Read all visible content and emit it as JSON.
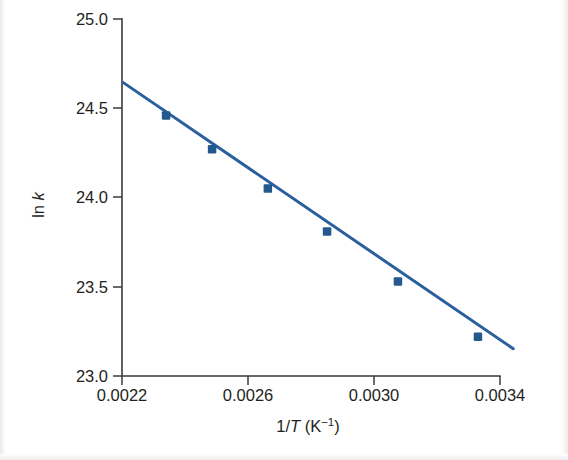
{
  "figure": {
    "background_color": "#ffffff",
    "axis_color": "#3b3b3b",
    "text_color": "#231f20"
  },
  "chart_data": {
    "type": "scatter",
    "title": "",
    "subtitle": "",
    "xlabel": "1/T (K⁻¹)",
    "ylabel": "ln k",
    "xlabel_parts": {
      "prefix": "1/",
      "italic_var": "T",
      "unit_open": " (K",
      "unit_exp": "−1",
      "unit_close": ")"
    },
    "ylabel_parts": {
      "prefix": "ln ",
      "italic_var": "k"
    },
    "xlim": [
      0.0022,
      0.0034
    ],
    "ylim": [
      23.0,
      25.0
    ],
    "xticks": [
      0.0022,
      0.0026,
      0.003,
      0.0034
    ],
    "xtick_labels": [
      "0.0022",
      "0.0026",
      "0.0030",
      "0.0034"
    ],
    "yticks": [
      23.0,
      23.5,
      24.0,
      24.5,
      25.0
    ],
    "ytick_labels": [
      "23.0",
      "23.5",
      "24.0",
      "24.5",
      "25.0"
    ],
    "grid": false,
    "legend": false,
    "legend_position": "none",
    "series": [
      {
        "name": "ln k vs 1/T",
        "marker": "square",
        "marker_color": "#23598f",
        "line_color": "#2a5f9e",
        "line_width": 3.0,
        "x": [
          0.00234,
          0.002486,
          0.002663,
          0.002851,
          0.003076,
          0.00333
        ],
        "y": [
          24.46,
          24.27,
          24.05,
          23.81,
          23.53,
          23.22
        ]
      }
    ],
    "fit_line": {
      "name": "best-fit line",
      "color": "#2a5f9e",
      "x_start": 0.002203,
      "y_start": 24.645,
      "x_end": 0.003442,
      "y_end": 23.153
    },
    "annotations": []
  }
}
